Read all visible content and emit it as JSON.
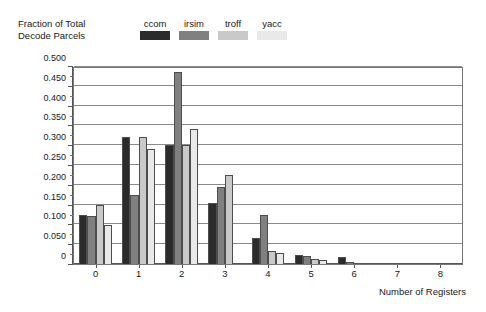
{
  "chart_data": {
    "type": "bar",
    "title": "",
    "ylabel": "Fraction of Total\nDecode Parcels",
    "xlabel": "Number of Registers",
    "categories": [
      "0",
      "1",
      "2",
      "3",
      "4",
      "5",
      "6",
      "7",
      "8"
    ],
    "ylim": [
      0,
      0.5
    ],
    "ytick_labels": [
      "0",
      "0.050",
      "0.100",
      "0.150",
      "0.200",
      "0.250",
      "0.300",
      "0.350",
      "0.400",
      "0.450",
      "0.500"
    ],
    "ytick_values": [
      0,
      0.05,
      0.1,
      0.15,
      0.2,
      0.25,
      0.3,
      0.35,
      0.4,
      0.45,
      0.5
    ],
    "grid": true,
    "legend_position": "top",
    "series": [
      {
        "name": "ccom",
        "color": "#2b2b2b",
        "values": [
          0.125,
          0.32,
          0.3,
          0.155,
          0.065,
          0.022,
          0.018,
          0.0,
          0.0
        ]
      },
      {
        "name": "irsim",
        "color": "#808080",
        "values": [
          0.12,
          0.175,
          0.485,
          0.195,
          0.125,
          0.02,
          0.005,
          0.0,
          0.0
        ]
      },
      {
        "name": "troff",
        "color": "#c9c9c9",
        "values": [
          0.15,
          0.32,
          0.3,
          0.225,
          0.032,
          0.013,
          0.0,
          0.0,
          0.0
        ]
      },
      {
        "name": "yacc",
        "color": "#e9e9e9",
        "values": [
          0.098,
          0.29,
          0.34,
          0.0,
          0.028,
          0.01,
          0.0,
          0.0,
          0.0
        ]
      }
    ]
  },
  "axes": {
    "y_title_text": "Fraction of Total\nDecode Parcels",
    "x_title_text": "Number of Registers"
  },
  "legend": {
    "entries": [
      {
        "label": "ccom",
        "color": "#2b2b2b"
      },
      {
        "label": "irsim",
        "color": "#808080"
      },
      {
        "label": "troff",
        "color": "#c9c9c9"
      },
      {
        "label": "yacc",
        "color": "#e9e9e9"
      }
    ]
  }
}
